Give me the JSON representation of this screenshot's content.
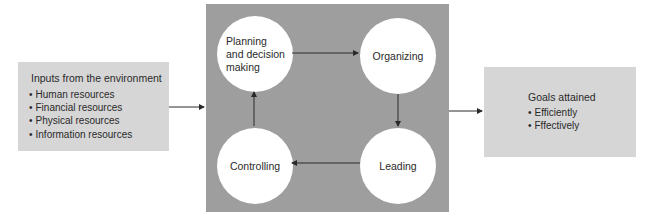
{
  "inputs": {
    "title": "Inputs from the environment",
    "items": [
      "Human resources",
      "Financial resources",
      "Physical resources",
      "Information resources"
    ]
  },
  "process": {
    "planning": [
      "Planning",
      "and decision",
      "making"
    ],
    "organizing": "Organizing",
    "leading": "Leading",
    "controlling": "Controlling"
  },
  "goals": {
    "title": "Goals attained",
    "items": [
      "Efficiently",
      "Fffectively"
    ]
  },
  "colors": {
    "box_fill": "#d6d6d6",
    "center_fill": "#9e9e9e",
    "circle_fill": "#ffffff",
    "arrow": "#2a2a2a"
  }
}
